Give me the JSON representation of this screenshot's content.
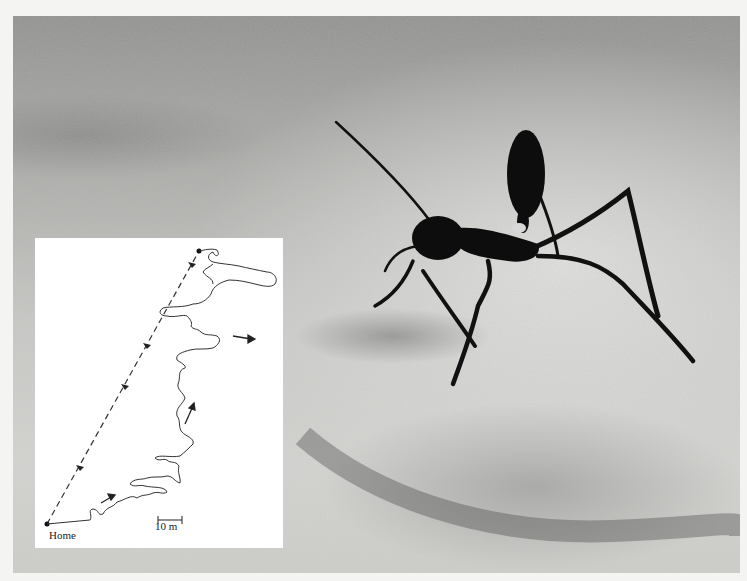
{
  "photo": {
    "subject": "desert-ant",
    "description": "Black long-legged desert ant standing on pale sand"
  },
  "inset_diagram": {
    "home_label": "Home",
    "scale_bar_label": "10 m",
    "outbound_path": "tortuous-foraging-path",
    "return_path": "straight-dashed-homeward-path",
    "colors": {
      "background": "#ffffff",
      "line": "#333333"
    }
  }
}
